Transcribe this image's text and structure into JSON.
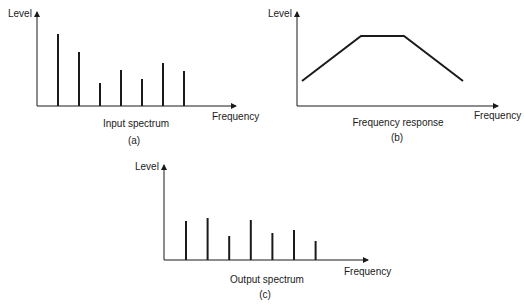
{
  "panels": [
    {
      "id": "a",
      "y_label": "Level",
      "x_label": "Frequency",
      "title": "Input spectrum",
      "caption": "(a)"
    },
    {
      "id": "b",
      "y_label": "Level",
      "x_label": "Frequency",
      "title": "Frequency response",
      "caption": "(b)"
    },
    {
      "id": "c",
      "y_label": "Level",
      "x_label": "Frequency",
      "title": "Output spectrum",
      "caption": "(c)"
    }
  ],
  "chart_data": [
    {
      "type": "bar",
      "title": "Input spectrum",
      "caption": "(a)",
      "xlabel": "Frequency",
      "ylabel": "Level",
      "categories": [
        "f1",
        "f2",
        "f3",
        "f4",
        "f5",
        "f6",
        "f7"
      ],
      "values": [
        72,
        54,
        23,
        36,
        27,
        43,
        35
      ],
      "ylim": [
        0,
        93
      ],
      "grid": false
    },
    {
      "type": "line",
      "title": "Frequency response",
      "caption": "(b)",
      "xlabel": "Frequency",
      "ylabel": "Level",
      "points": [
        [
          5,
          24
        ],
        [
          64,
          69
        ],
        [
          107,
          69
        ],
        [
          166,
          24
        ]
      ],
      "ylim": [
        0,
        93
      ],
      "grid": false
    },
    {
      "type": "bar",
      "title": "Output spectrum",
      "caption": "(c)",
      "xlabel": "Frequency",
      "ylabel": "Level",
      "categories": [
        "f1",
        "f2",
        "f3",
        "f4",
        "f5",
        "f6",
        "f7"
      ],
      "values": [
        39,
        42,
        24,
        40,
        27,
        30,
        19
      ],
      "ylim": [
        0,
        95
      ],
      "grid": false
    }
  ]
}
